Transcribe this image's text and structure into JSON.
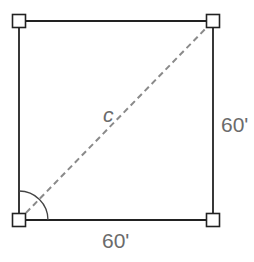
{
  "diagram": {
    "type": "square-diagonal",
    "labels": {
      "diagonal": "c",
      "right_side": "60'",
      "bottom_side": "60'"
    },
    "colors": {
      "sides": "#222222",
      "diagonal": "#8a8a8a",
      "labels": "#6b6b6b"
    }
  }
}
